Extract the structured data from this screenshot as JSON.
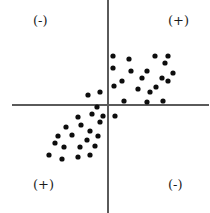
{
  "chart_data": {
    "type": "scatter",
    "title": "",
    "xlabel": "",
    "ylabel": "",
    "xlim": [
      -108,
      102
    ],
    "ylim": [
      -108,
      105
    ],
    "grid": false,
    "legend": null,
    "axes": {
      "style": "crossed-quadrant-axes",
      "origin_px": [
        108,
        105
      ],
      "color": "#5a5a5a",
      "line_width": 1.4,
      "x_axis_extent_px": [
        12,
        209
      ],
      "y_axis_extent_px": [
        0,
        213
      ]
    },
    "point_style": {
      "marker": "circle",
      "color": "#0d0d0d",
      "radius_px": 2.6
    },
    "annotations": [
      {
        "name": "top-left-sign",
        "text": "(-)",
        "quadrant": "upper-left"
      },
      {
        "name": "top-right-sign",
        "text": "(+)",
        "quadrant": "upper-right"
      },
      {
        "name": "bottom-left-sign",
        "text": "(+)",
        "quadrant": "lower-left"
      },
      {
        "name": "bottom-right-sign",
        "text": "(-)",
        "quadrant": "lower-right"
      }
    ],
    "series": [
      {
        "name": "upper-right-cluster",
        "quadrant": "upper-right",
        "count": 20,
        "points": [
          [
            113,
            56
          ],
          [
            129,
            59
          ],
          [
            155,
            56
          ],
          [
            168,
            56
          ],
          [
            131,
            71
          ],
          [
            122,
            81
          ],
          [
            147,
            71
          ],
          [
            165,
            63
          ],
          [
            173,
            73
          ],
          [
            168,
            81
          ],
          [
            162,
            78
          ],
          [
            142,
            78
          ],
          [
            114,
            86
          ],
          [
            138,
            89
          ],
          [
            156,
            87
          ],
          [
            113,
            68
          ],
          [
            124,
            101
          ],
          [
            147,
            102
          ],
          [
            163,
            101
          ],
          [
            150,
            92
          ]
        ]
      },
      {
        "name": "lower-left-cluster",
        "quadrant": "lower-left",
        "count": 19,
        "points": [
          [
            78,
            117
          ],
          [
            92,
            114
          ],
          [
            103,
            116
          ],
          [
            66,
            127
          ],
          [
            81,
            125
          ],
          [
            90,
            131
          ],
          [
            100,
            122
          ],
          [
            58,
            136
          ],
          [
            72,
            135
          ],
          [
            87,
            140
          ],
          [
            98,
            136
          ],
          [
            64,
            147
          ],
          [
            80,
            147
          ],
          [
            95,
            146
          ],
          [
            49,
            155
          ],
          [
            62,
            159
          ],
          [
            78,
            157
          ],
          [
            90,
            155
          ],
          [
            55,
            143
          ]
        ]
      },
      {
        "name": "near-origin-points",
        "quadrant": "straddling-origin",
        "count": 4,
        "points": [
          [
            88,
            95
          ],
          [
            100,
            92
          ],
          [
            115,
            116
          ],
          [
            97,
            107
          ]
        ]
      }
    ]
  }
}
